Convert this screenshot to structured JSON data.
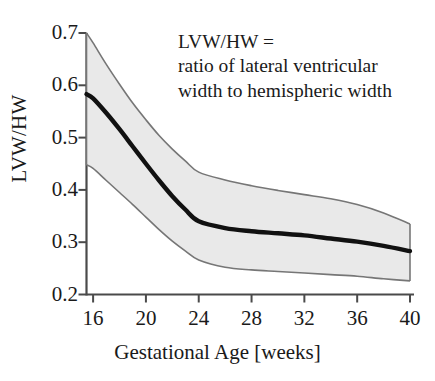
{
  "chart_data": {
    "type": "area",
    "title": "",
    "xlabel": "Gestational Age [weeks]",
    "ylabel": "LVW/HW",
    "xlim": [
      15.5,
      40
    ],
    "ylim": [
      0.2,
      0.7
    ],
    "xticks": [
      16,
      20,
      24,
      28,
      32,
      36,
      40
    ],
    "yticks": [
      0.2,
      0.3,
      0.4,
      0.5,
      0.6,
      0.7
    ],
    "xtick_labels": [
      "16",
      "20",
      "24",
      "28",
      "32",
      "36",
      "40"
    ],
    "ytick_labels": [
      "0.2",
      "0.3",
      "0.4",
      "0.5",
      "0.6",
      "0.7"
    ],
    "grid": false,
    "legend": "none",
    "x": [
      15.5,
      16,
      17,
      18,
      19,
      20,
      21,
      22,
      23,
      24,
      26,
      28,
      30,
      32,
      34,
      36,
      38,
      40
    ],
    "series": [
      {
        "name": "upper limit",
        "role": "band-upper",
        "values": [
          0.7,
          0.681,
          0.64,
          0.602,
          0.566,
          0.534,
          0.504,
          0.478,
          0.455,
          0.434,
          0.419,
          0.408,
          0.399,
          0.391,
          0.383,
          0.372,
          0.356,
          0.335
        ]
      },
      {
        "name": "mean",
        "role": "line",
        "values": [
          0.583,
          0.575,
          0.547,
          0.516,
          0.483,
          0.45,
          0.418,
          0.388,
          0.362,
          0.34,
          0.327,
          0.321,
          0.317,
          0.313,
          0.307,
          0.301,
          0.293,
          0.283
        ]
      },
      {
        "name": "lower limit",
        "role": "band-lower",
        "values": [
          0.448,
          0.441,
          0.418,
          0.395,
          0.372,
          0.348,
          0.324,
          0.302,
          0.283,
          0.266,
          0.252,
          0.247,
          0.244,
          0.241,
          0.238,
          0.235,
          0.23,
          0.226
        ]
      }
    ],
    "annotations": [
      "LVW/HW =",
      "ratio of lateral ventricular",
      "width to hemispheric width"
    ],
    "colors": {
      "band_fill": "#e9e9e9",
      "band_edge": "#6b6b6b",
      "mean_line": "#111111",
      "axis": "#4a4a4a",
      "text": "#1a1a1a",
      "background": "#ffffff"
    }
  },
  "annotation": {
    "line1": "LVW/HW =",
    "line2": "ratio of lateral ventricular",
    "line3": "width to hemispheric width"
  },
  "axes": {
    "y_title": "LVW/HW",
    "x_title": "Gestational Age [weeks]"
  }
}
